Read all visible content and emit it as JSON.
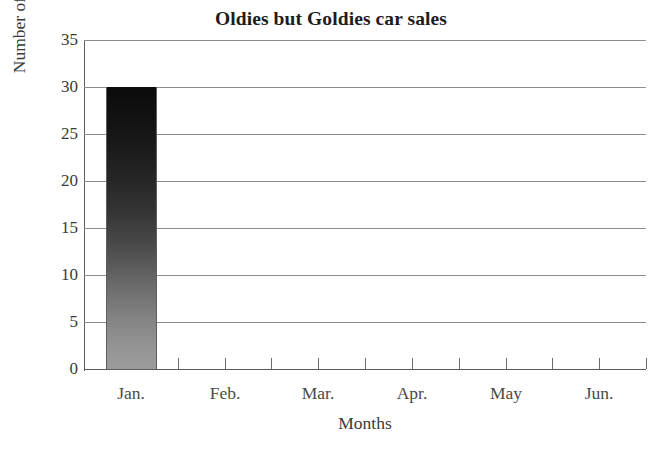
{
  "chart_data": {
    "type": "bar",
    "title": "Oldies but Goldies car sales",
    "xlabel": "Months",
    "ylabel": "Number of cars sold",
    "categories": [
      "Jan.",
      "Feb.",
      "Mar.",
      "Apr.",
      "May",
      "Jun."
    ],
    "values": [
      30,
      0,
      0,
      0,
      0,
      0
    ],
    "series": [
      {
        "name": "Number of cars sold",
        "values": [
          30,
          0,
          0,
          0,
          0,
          0
        ]
      }
    ],
    "ylim": [
      0,
      35
    ],
    "yticks": [
      0,
      5,
      10,
      15,
      20,
      25,
      30,
      35
    ],
    "ytick_labels": [
      "0",
      "5",
      "10",
      "15",
      "20",
      "25",
      "30",
      "35"
    ],
    "grid": true,
    "grid_axis": "y",
    "legend": false,
    "legend_position": "none",
    "bar_fill_top_color": "#0b0b0b",
    "bar_fill_bottom_color": "#9c9c9c",
    "bar_edge_color": "#5d5d5d",
    "gridline_color": "#8d8d8d",
    "axis_color": "#5b5b5b",
    "background_color": "#ffffff",
    "text_color": "#3a3a3a",
    "title_color": "#1d1d1d"
  }
}
